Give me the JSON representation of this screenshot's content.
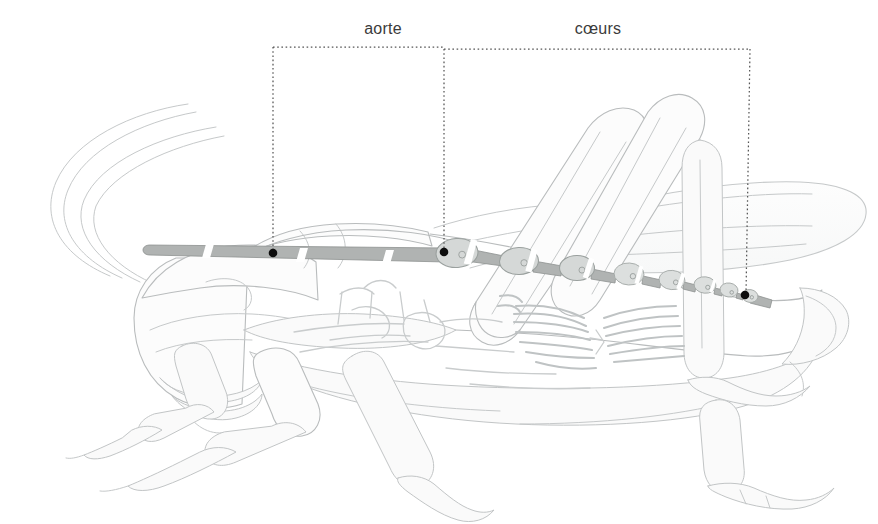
{
  "figure": {
    "background_color": "#ffffff"
  },
  "labels": [
    {
      "id": "aorte",
      "text": "aorte",
      "x": 383,
      "y": 20
    },
    {
      "id": "coeurs",
      "text": "cœurs",
      "x": 598,
      "y": 20
    }
  ],
  "leader_brackets": [
    {
      "id": "bracket-aorte",
      "label_ref": "aorte",
      "top_y": 47,
      "left_x": 273,
      "right_x": 444,
      "anchor_left": {
        "x": 273,
        "y": 253
      },
      "anchor_right": {
        "x": 444,
        "y": 252
      },
      "style": "dotted",
      "color": "#555555"
    },
    {
      "id": "bracket-coeurs",
      "label_ref": "cœurs",
      "top_y": 49,
      "left_x": 444,
      "right_x": 750,
      "anchor_left": {
        "x": 444,
        "y": 252
      },
      "anchor_right": {
        "x": 745,
        "y": 295
      },
      "style": "dotted",
      "color": "#555555"
    }
  ],
  "anchor_dots": [
    {
      "id": "dot-aorta-anterior",
      "x": 273,
      "y": 253,
      "r": 4.2
    },
    {
      "id": "dot-heart-first",
      "x": 444,
      "y": 252,
      "r": 4.2
    },
    {
      "id": "dot-heart-last",
      "x": 745,
      "y": 295,
      "r": 4.2
    }
  ],
  "colors": {
    "outline": "#b9bcbd",
    "outline_soft": "#cfd2d3",
    "body_fill": "#fbfbfb",
    "vessel_fill": "#b0b3b2",
    "vessel_stroke": "#8e9291",
    "chamber_fill": "#d3d6d5",
    "chamber_stroke": "#9aa09e",
    "label_text": "#3b3b3b",
    "leader_line": "#555555",
    "viscera": "#c9cccd"
  },
  "structures": {
    "aorta": {
      "name": "aorte",
      "description": "tube dorsal étroit traversant la tête et le thorax",
      "start": {
        "x": 148,
        "y": 247
      },
      "end": {
        "x": 444,
        "y": 252
      }
    },
    "hearts": {
      "name": "cœurs",
      "description": "série de chambres contractiles (ampoules) le long de l'abdomen",
      "chamber_count": 8,
      "chambers": [
        {
          "index": 1,
          "cx": 457,
          "cy": 253,
          "rx": 20,
          "ry": 14,
          "angle": -4
        },
        {
          "index": 2,
          "cx": 519,
          "cy": 261,
          "rx": 19,
          "ry": 13,
          "angle": -2
        },
        {
          "index": 3,
          "cx": 577,
          "cy": 268,
          "rx": 17,
          "ry": 12,
          "angle": 1
        },
        {
          "index": 4,
          "cx": 629,
          "cy": 274,
          "rx": 15,
          "ry": 11,
          "angle": 3
        },
        {
          "index": 5,
          "cx": 672,
          "cy": 280,
          "rx": 13,
          "ry": 10,
          "angle": 5
        },
        {
          "index": 6,
          "cx": 705,
          "cy": 285,
          "rx": 11,
          "ry": 8,
          "angle": 6
        },
        {
          "index": 7,
          "cx": 729,
          "cy": 290,
          "rx": 9,
          "ry": 7,
          "angle": 8
        },
        {
          "index": 8,
          "cx": 748,
          "cy": 295,
          "rx": 7,
          "ry": 6,
          "angle": 9
        }
      ]
    },
    "body_parts": [
      {
        "id": "head",
        "label": "tête"
      },
      {
        "id": "antennae",
        "label": "antennes"
      },
      {
        "id": "pronotum",
        "label": "pronotum"
      },
      {
        "id": "abdomen",
        "label": "abdomen"
      },
      {
        "id": "forewing",
        "label": "aile antérieure"
      },
      {
        "id": "hindleg",
        "label": "patte postérieure"
      },
      {
        "id": "midleg",
        "label": "patte médiane"
      },
      {
        "id": "foreleg",
        "label": "patte antérieure"
      },
      {
        "id": "alary-muscles",
        "label": "muscles alaires"
      },
      {
        "id": "nerve-cord",
        "label": "chaîne nerveuse"
      }
    ]
  }
}
